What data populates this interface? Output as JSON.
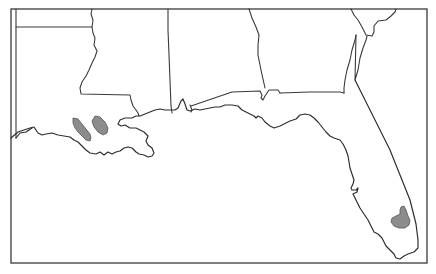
{
  "map": {
    "type": "distribution-range-map",
    "region": "Southeastern United States (Gulf Coast)",
    "states_shown": [
      "Louisiana",
      "Mississippi",
      "Alabama",
      "Georgia",
      "Florida",
      "Arkansas (partial)",
      "Texas (edge)",
      "South Carolina (edge)"
    ],
    "colors": {
      "background": "#ffffff",
      "border_line": "#3a3a3a",
      "range_fill": "#8c8c8c"
    },
    "range_areas": [
      {
        "name": "southwest-louisiana-west",
        "location": "SW Louisiana"
      },
      {
        "name": "southwest-louisiana-east",
        "location": "S-central Louisiana"
      },
      {
        "name": "south-florida",
        "location": "SE Florida (Lake Okeechobee area)"
      }
    ]
  }
}
